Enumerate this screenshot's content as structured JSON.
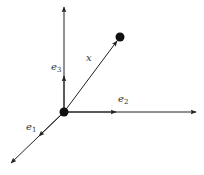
{
  "diagram": {
    "type": "vector-diagram",
    "colors": {
      "stroke": "#222222",
      "label": "#333333",
      "background": "#ffffff"
    },
    "origin": {
      "x": 64,
      "y": 112
    },
    "point_x": {
      "x": 120,
      "y": 37
    },
    "axes": [
      {
        "id": "e1",
        "label": "e",
        "subscript": "1",
        "tip": {
          "x": 10,
          "y": 164
        }
      },
      {
        "id": "e2",
        "label": "e",
        "subscript": "2",
        "tip": {
          "x": 196,
          "y": 112
        }
      },
      {
        "id": "e3",
        "label": "e",
        "subscript": "3",
        "tip": {
          "x": 64,
          "y": 6
        }
      }
    ],
    "vector": {
      "id": "x",
      "label": "x"
    }
  }
}
